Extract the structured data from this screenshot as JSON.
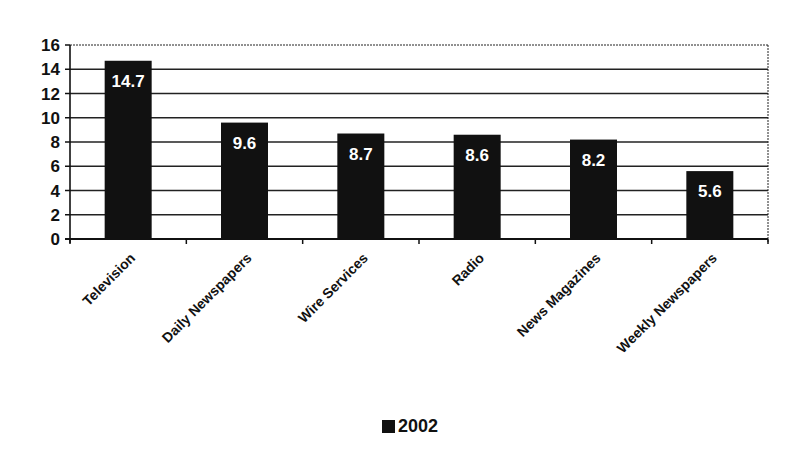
{
  "chart_data": {
    "type": "bar",
    "title": "",
    "xlabel": "",
    "ylabel": "",
    "categories": [
      "Television",
      "Daily Newspapers",
      "Wire Services",
      "Radio",
      "News Magazines",
      "Weekly Newspapers"
    ],
    "series": [
      {
        "name": "2002",
        "values": [
          14.7,
          9.6,
          8.7,
          8.6,
          8.2,
          5.6
        ],
        "color": "#111111"
      }
    ],
    "data_labels": [
      "14.7",
      "9.6",
      "8.7",
      "8.6",
      "8.2",
      "5.6"
    ],
    "ylim": [
      0,
      16
    ],
    "yticks": [
      0,
      2,
      4,
      6,
      8,
      10,
      12,
      14,
      16
    ],
    "grid": true,
    "legend_position": "bottom"
  },
  "legend": {
    "label": "2002"
  },
  "colors": {
    "bar": "#111111",
    "grid": "#222222",
    "background": "#ffffff",
    "bar_label": "#ffffff"
  }
}
